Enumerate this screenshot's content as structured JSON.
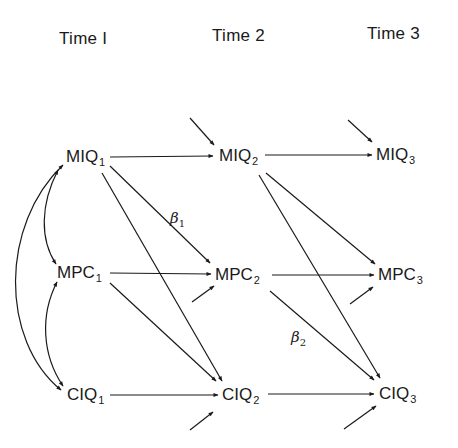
{
  "headers": {
    "time1": "Time I",
    "time2": "Time 2",
    "time3": "Time 3"
  },
  "nodes": {
    "miq1": {
      "name": "MIQ",
      "sub": "1"
    },
    "miq2": {
      "name": "MIQ",
      "sub": "2"
    },
    "miq3": {
      "name": "MIQ",
      "sub": "3"
    },
    "mpc1": {
      "name": "MPC",
      "sub": "1"
    },
    "mpc2": {
      "name": "MPC",
      "sub": "2"
    },
    "mpc3": {
      "name": "MPC",
      "sub": "3"
    },
    "ciq1": {
      "name": "CIQ",
      "sub": "1"
    },
    "ciq2": {
      "name": "CIQ",
      "sub": "2"
    },
    "ciq3": {
      "name": "CIQ",
      "sub": "3"
    }
  },
  "coefficients": {
    "beta1": {
      "symbol": "β",
      "sub": "1"
    },
    "beta2": {
      "symbol": "β",
      "sub": "2"
    }
  },
  "edges": [
    {
      "from": "MIQ1",
      "to": "MIQ2"
    },
    {
      "from": "MIQ1",
      "to": "MPC2",
      "label": "β1"
    },
    {
      "from": "MIQ1",
      "to": "CIQ2"
    },
    {
      "from": "MPC1",
      "to": "MPC2"
    },
    {
      "from": "MPC1",
      "to": "CIQ2"
    },
    {
      "from": "CIQ1",
      "to": "CIQ2"
    },
    {
      "from": "MIQ2",
      "to": "MIQ3"
    },
    {
      "from": "MIQ2",
      "to": "MPC3"
    },
    {
      "from": "MIQ2",
      "to": "CIQ3"
    },
    {
      "from": "MPC2",
      "to": "MPC3"
    },
    {
      "from": "MPC2",
      "to": "CIQ3",
      "label": "β2"
    },
    {
      "from": "CIQ2",
      "to": "CIQ3"
    }
  ],
  "correlations": [
    {
      "between": [
        "MIQ1",
        "MPC1"
      ]
    },
    {
      "between": [
        "MPC1",
        "CIQ1"
      ]
    },
    {
      "between": [
        "MIQ1",
        "CIQ1"
      ]
    }
  ],
  "disturbances": [
    "MIQ2",
    "MPC2",
    "CIQ2",
    "MIQ3",
    "MPC3",
    "CIQ3"
  ]
}
